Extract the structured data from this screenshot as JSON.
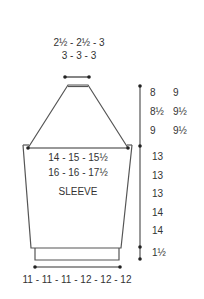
{
  "diagram": {
    "title": "SLEEVE",
    "cap_top_width": {
      "line1": "2½ - 2½ - 3",
      "line2": "3 - 3 - 3"
    },
    "upper_arm_width": {
      "line1": "14 - 15 - 15½",
      "line2": "16 - 16 - 17½"
    },
    "cuff_width": "11 - 11 - 11 - 12 - 12 - 12",
    "cap_height": {
      "col1": [
        "8",
        "8½",
        "9"
      ],
      "col2": [
        "9",
        "9½",
        "9½"
      ]
    },
    "sleeve_length": [
      "13",
      "13",
      "13",
      "14",
      "14"
    ],
    "cuff_height": "1½",
    "colors": {
      "line": "#555555",
      "text": "#333333",
      "background": "#ffffff"
    }
  }
}
